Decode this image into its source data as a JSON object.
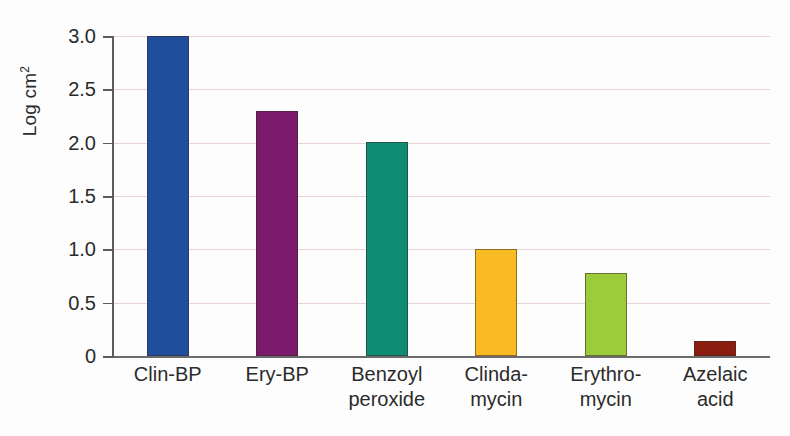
{
  "chart_data": {
    "type": "bar",
    "title": "",
    "xlabel": "",
    "ylabel": "Log cm2",
    "ylabel_html": "Log cm",
    "ylabel_sup": "2",
    "categories": [
      "Clin-BP",
      "Ery-BP",
      "Benzoyl peroxide",
      "Clinda-mycin",
      "Erythro-mycin",
      "Azelaic acid"
    ],
    "category_lines": [
      [
        "Clin-BP",
        ""
      ],
      [
        "Ery-BP",
        ""
      ],
      [
        "Benzoyl",
        "peroxide"
      ],
      [
        "Clinda-",
        "mycin"
      ],
      [
        "Erythro-",
        "mycin"
      ],
      [
        "Azelaic",
        "acid"
      ]
    ],
    "values": [
      3.0,
      2.3,
      2.01,
      1.0,
      0.78,
      0.14
    ],
    "colors": [
      "#1f4e9c",
      "#7b1a6b",
      "#0e8d74",
      "#f8bb24",
      "#9ccc3c",
      "#8b1c10"
    ],
    "ylim": [
      0,
      3.0
    ],
    "yticks": [
      0,
      0.5,
      1.0,
      1.5,
      2.0,
      2.5,
      3.0
    ],
    "ytick_labels": [
      "0",
      "0.5",
      "1.0",
      "1.5",
      "2.0",
      "2.5",
      "3.0"
    ],
    "grid": true,
    "grid_color": "#e6d6d2",
    "legend": "none",
    "axis_color": "#5c5c5c",
    "background": "#fdfdfd"
  }
}
